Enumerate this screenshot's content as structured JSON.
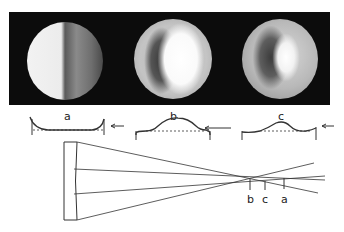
{
  "figure": {
    "images": [
      {
        "id": "a",
        "label": "a",
        "pattern": "half-shadow, left bright, right dark"
      },
      {
        "id": "b",
        "label": "b",
        "pattern": "dark left crescent, bright center-right"
      },
      {
        "id": "c",
        "label": "c",
        "pattern": "dark left zone, bright center"
      }
    ],
    "profiles": [
      {
        "label": "a",
        "shape": "concave-edges"
      },
      {
        "label": "b",
        "shape": "central-hump"
      },
      {
        "label": "c",
        "shape": "wavy-zone"
      }
    ],
    "ray_diagram": {
      "focus_labels": [
        "b",
        "c",
        "a"
      ]
    },
    "colors": {
      "panel": "#0c0c0c",
      "line": "#333333"
    }
  }
}
